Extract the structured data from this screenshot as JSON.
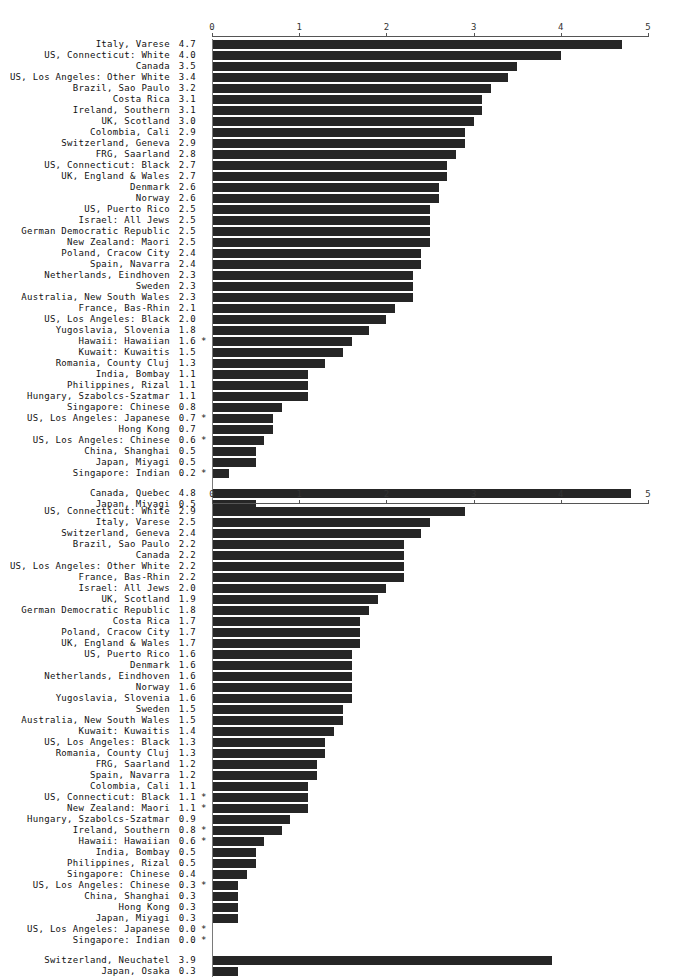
{
  "figure": {
    "axis_ticks": [
      "0",
      "1",
      "2",
      "3",
      "4",
      "5"
    ],
    "axis_min": 0,
    "axis_max": 5,
    "bar_color": "#262626",
    "axis_color": "#555555"
  },
  "chart_data": [
    {
      "type": "bar",
      "orientation": "horizontal",
      "title": "",
      "xlabel": "",
      "ylabel": "",
      "xlim": [
        0,
        5
      ],
      "xticks": [
        0,
        1,
        2,
        3,
        4,
        5
      ],
      "grid": false,
      "legend": "none",
      "categories": [
        "Italy, Varese",
        "US, Connecticut: White",
        "Canada",
        "US, Los Angeles: Other White",
        "Brazil, Sao Paulo",
        "Costa Rica",
        "Ireland, Southern",
        "UK, Scotland",
        "Colombia, Cali",
        "Switzerland, Geneva",
        "FRG, Saarland",
        "US, Connecticut: Black",
        "UK, England & Wales",
        "Denmark",
        "Norway",
        "US, Puerto Rico",
        "Israel: All Jews",
        "German Democratic Republic",
        "New Zealand: Maori",
        "Poland, Cracow City",
        "Spain, Navarra",
        "Netherlands, Eindhoven",
        "Sweden",
        "Australia, New South Wales",
        "France, Bas-Rhin",
        "US, Los Angeles: Black",
        "Yugoslavia, Slovenia",
        "Hawaii: Hawaiian",
        "Kuwait: Kuwaitis",
        "Romania, County Cluj",
        "India, Bombay",
        "Philippines, Rizal",
        "Hungary, Szabolcs-Szatmar",
        "Singapore: Chinese",
        "US, Los Angeles: Japanese",
        "Hong Kong",
        "US, Los Angeles: Chinese",
        "China, Shanghai",
        "Japan, Miyagi",
        "Singapore: Indian"
      ],
      "values": [
        4.7,
        4.0,
        3.5,
        3.4,
        3.2,
        3.1,
        3.1,
        3.0,
        2.9,
        2.9,
        2.8,
        2.7,
        2.7,
        2.6,
        2.6,
        2.5,
        2.5,
        2.5,
        2.5,
        2.4,
        2.4,
        2.3,
        2.3,
        2.3,
        2.1,
        2.0,
        1.8,
        1.6,
        1.5,
        1.3,
        1.1,
        1.1,
        1.1,
        0.8,
        0.7,
        0.7,
        0.6,
        0.5,
        0.5,
        0.2
      ],
      "value_labels": [
        "4.7",
        "4.0",
        "3.5",
        "3.4",
        "3.2",
        "3.1",
        "3.1",
        "3.0",
        "2.9",
        "2.9",
        "2.8",
        "2.7",
        "2.7",
        "2.6",
        "2.6",
        "2.5",
        "2.5",
        "2.5",
        "2.5",
        "2.4",
        "2.4",
        "2.3",
        "2.3",
        "2.3",
        "2.1",
        "2.0",
        "1.8",
        "1.6",
        "1.5",
        "1.3",
        "1.1",
        "1.1",
        "1.1",
        "0.8",
        "0.7",
        "0.7",
        "0.6",
        "0.5",
        "0.5",
        "0.2"
      ],
      "starred": [
        false,
        false,
        false,
        false,
        false,
        false,
        false,
        false,
        false,
        false,
        false,
        false,
        false,
        false,
        false,
        false,
        false,
        false,
        false,
        false,
        false,
        false,
        false,
        false,
        false,
        false,
        false,
        true,
        false,
        false,
        false,
        false,
        false,
        false,
        true,
        false,
        true,
        false,
        false,
        true
      ],
      "extra_group": {
        "categories": [
          "Canada, Quebec",
          "Japan, Miyagi"
        ],
        "values": [
          4.8,
          0.5
        ],
        "value_labels": [
          "4.8",
          "0.5"
        ],
        "starred": [
          false,
          false
        ]
      }
    },
    {
      "type": "bar",
      "orientation": "horizontal",
      "title": "",
      "xlabel": "",
      "ylabel": "",
      "xlim": [
        0,
        5
      ],
      "xticks": [
        0,
        1,
        2,
        3,
        4,
        5
      ],
      "grid": false,
      "legend": "none",
      "categories": [
        "US, Connecticut: White",
        "Italy, Varese",
        "Switzerland, Geneva",
        "Brazil, Sao Paulo",
        "Canada",
        "US, Los Angeles: Other White",
        "France, Bas-Rhin",
        "Israel: All Jews",
        "UK, Scotland",
        "German Democratic Republic",
        "Costa Rica",
        "Poland, Cracow City",
        "UK, England & Wales",
        "US, Puerto Rico",
        "Denmark",
        "Netherlands, Eindhoven",
        "Norway",
        "Yugoslavia, Slovenia",
        "Sweden",
        "Australia, New South Wales",
        "Kuwait: Kuwaitis",
        "US, Los Angeles: Black",
        "Romania, County Cluj",
        "FRG, Saarland",
        "Spain, Navarra",
        "Colombia, Cali",
        "US, Connecticut: Black",
        "New Zealand: Maori",
        "Hungary, Szabolcs-Szatmar",
        "Ireland, Southern",
        "Hawaii: Hawaiian",
        "India, Bombay",
        "Philippines, Rizal",
        "Singapore: Chinese",
        "US, Los Angeles: Chinese",
        "China, Shanghai",
        "Hong Kong",
        "Japan, Miyagi",
        "US, Los Angeles: Japanese",
        "Singapore: Indian"
      ],
      "values": [
        2.9,
        2.5,
        2.4,
        2.2,
        2.2,
        2.2,
        2.2,
        2.0,
        1.9,
        1.8,
        1.7,
        1.7,
        1.7,
        1.6,
        1.6,
        1.6,
        1.6,
        1.6,
        1.5,
        1.5,
        1.4,
        1.3,
        1.3,
        1.2,
        1.2,
        1.1,
        1.1,
        1.1,
        0.9,
        0.8,
        0.6,
        0.5,
        0.5,
        0.4,
        0.3,
        0.3,
        0.3,
        0.3,
        0.0,
        0.0
      ],
      "value_labels": [
        "2.9",
        "2.5",
        "2.4",
        "2.2",
        "2.2",
        "2.2",
        "2.2",
        "2.0",
        "1.9",
        "1.8",
        "1.7",
        "1.7",
        "1.7",
        "1.6",
        "1.6",
        "1.6",
        "1.6",
        "1.6",
        "1.5",
        "1.5",
        "1.4",
        "1.3",
        "1.3",
        "1.2",
        "1.2",
        "1.1",
        "1.1",
        "1.1",
        "0.9",
        "0.8",
        "0.6",
        "0.5",
        "0.5",
        "0.4",
        "0.3",
        "0.3",
        "0.3",
        "0.3",
        "0.0",
        "0.0"
      ],
      "starred": [
        false,
        false,
        false,
        false,
        false,
        false,
        false,
        false,
        false,
        false,
        false,
        false,
        false,
        false,
        false,
        false,
        false,
        false,
        false,
        false,
        false,
        false,
        false,
        false,
        false,
        false,
        true,
        true,
        false,
        true,
        true,
        false,
        false,
        false,
        true,
        false,
        false,
        false,
        true,
        true
      ],
      "extra_group": {
        "categories": [
          "Switzerland, Neuchatel",
          "Japan, Osaka"
        ],
        "values": [
          3.9,
          0.3
        ],
        "value_labels": [
          "3.9",
          "0.3"
        ],
        "starred": [
          false,
          false
        ]
      }
    }
  ]
}
